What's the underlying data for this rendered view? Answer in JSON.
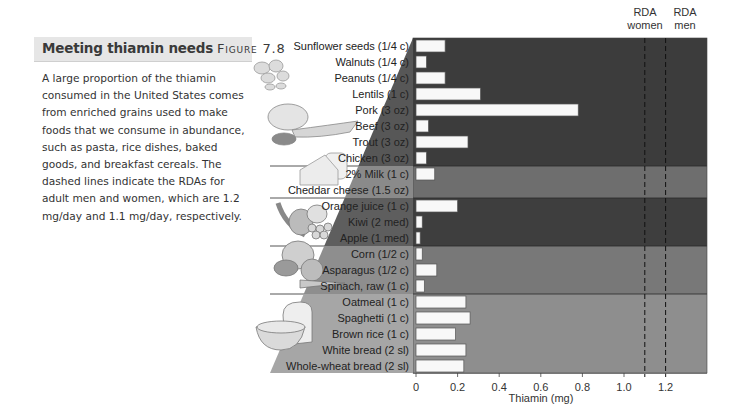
{
  "caption": {
    "title": "Meeting thiamin needs",
    "figure": "Figure 7.8",
    "body": "A large proportion of the thiamin consumed in the United States comes from enriched grains used to make foods that we consume in abundance, such as pasta, rice dishes, baked goods, and breakfast cereals. The dashed lines indicate the RDAs for adult men and women, which are 1.2 mg/day and 1.1 mg/day, respectively."
  },
  "chart_data": {
    "type": "bar",
    "orientation": "horizontal",
    "title": "Meeting thiamin needs",
    "xlabel": "Thiamin (mg)",
    "ylabel": "",
    "xlim": [
      0,
      1.4
    ],
    "xticks": [
      0,
      0.2,
      0.4,
      0.6,
      0.8,
      1.0,
      1.2
    ],
    "xtick_labels": [
      "0",
      "0.2",
      "0.4",
      "0.6",
      "0.8",
      "1.0",
      "1.2"
    ],
    "grid": false,
    "categories": [
      "Sunflower seeds (1/4 c)",
      "Walnuts (1/4 c)",
      "Peanuts (1/4 c)",
      "Lentils (1 c)",
      "Pork (3 oz)",
      "Beef (3 oz)",
      "Trout (3 oz)",
      "Chicken (3 oz)",
      "2% Milk (1 c)",
      "Cheddar cheese (1.5 oz)",
      "Orange juice (1 c)",
      "Kiwi (2 med)",
      "Apple (1 med)",
      "Corn (1/2 c)",
      "Asparagus (1/2 c)",
      "Spinach, raw (1 c)",
      "Oatmeal (1 c)",
      "Spaghetti (1 c)",
      "Brown rice (1 c)",
      "White bread (2 sl)",
      "Whole-wheat bread (2 sl)"
    ],
    "values": [
      0.14,
      0.05,
      0.14,
      0.31,
      0.78,
      0.06,
      0.25,
      0.05,
      0.09,
      0.01,
      0.2,
      0.03,
      0.02,
      0.03,
      0.1,
      0.04,
      0.24,
      0.26,
      0.19,
      0.24,
      0.23
    ],
    "groups": [
      {
        "name": "Meat and beans",
        "start": 0,
        "end": 7,
        "color": "#3c3c3c"
      },
      {
        "name": "Milk",
        "start": 8,
        "end": 9,
        "color": "#6e6e6e"
      },
      {
        "name": "Fruits",
        "start": 10,
        "end": 12,
        "color": "#3e3e3e"
      },
      {
        "name": "Vegetables",
        "start": 13,
        "end": 15,
        "color": "#787878"
      },
      {
        "name": "Grains",
        "start": 16,
        "end": 20,
        "color": "#8e8e8e"
      }
    ],
    "reference_lines": [
      {
        "label": "RDA women",
        "value": 1.1,
        "style": "dashed"
      },
      {
        "label": "RDA men",
        "value": 1.2,
        "style": "dashed"
      }
    ]
  },
  "rda": {
    "women_line1": "RDA",
    "women_line2": "women",
    "men_line1": "RDA",
    "men_line2": "men"
  },
  "colors": {
    "bar_fill": "#f8f8f8",
    "bar_stroke": "#555555",
    "header_bg": "#e6e6e6"
  }
}
